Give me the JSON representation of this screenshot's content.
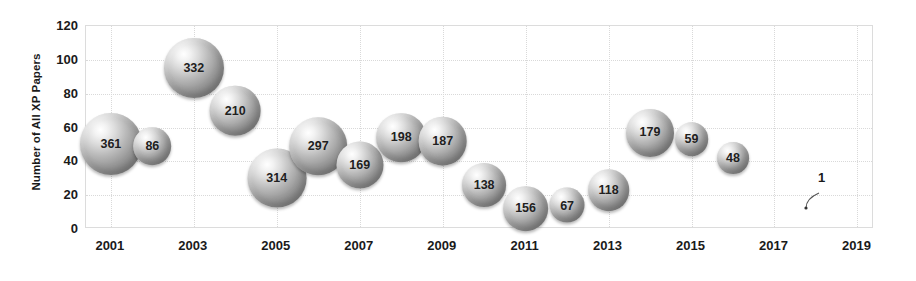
{
  "chart_data": {
    "type": "scatter",
    "title": "",
    "subtitle": "",
    "xlabel": "",
    "ylabel": "Number of All XP Papers",
    "xlim": [
      2000.4,
      2019.4
    ],
    "ylim": [
      0,
      120
    ],
    "grid": true,
    "legend": null,
    "x_ticks": [
      "2001",
      "2003",
      "2005",
      "2007",
      "2009",
      "2011",
      "2013",
      "2015",
      "2017",
      "2019"
    ],
    "x_tick_values": [
      2001,
      2003,
      2005,
      2007,
      2009,
      2011,
      2013,
      2015,
      2017,
      2019
    ],
    "y_ticks": [
      "0",
      "20",
      "40",
      "60",
      "80",
      "100",
      "120"
    ],
    "y_tick_values": [
      0,
      20,
      40,
      60,
      80,
      100,
      120
    ],
    "series": [
      {
        "name": "XP papers",
        "points": [
          {
            "x": 2001,
            "y": 50,
            "size": 361,
            "label": "361"
          },
          {
            "x": 2002,
            "y": 49,
            "size": 86,
            "label": "86"
          },
          {
            "x": 2003,
            "y": 95,
            "size": 332,
            "label": "332"
          },
          {
            "x": 2004,
            "y": 70,
            "size": 210,
            "label": "210"
          },
          {
            "x": 2005,
            "y": 30,
            "size": 314,
            "label": "314"
          },
          {
            "x": 2006,
            "y": 49,
            "size": 297,
            "label": "297"
          },
          {
            "x": 2007,
            "y": 38,
            "size": 169,
            "label": "169"
          },
          {
            "x": 2008,
            "y": 54,
            "size": 198,
            "label": "198"
          },
          {
            "x": 2009,
            "y": 52,
            "size": 187,
            "label": "187"
          },
          {
            "x": 2010,
            "y": 26,
            "size": 138,
            "label": "138"
          },
          {
            "x": 2011,
            "y": 12,
            "size": 156,
            "label": "156"
          },
          {
            "x": 2012,
            "y": 14,
            "size": 67,
            "label": "67"
          },
          {
            "x": 2013,
            "y": 23,
            "size": 118,
            "label": "118"
          },
          {
            "x": 2014,
            "y": 57,
            "size": 179,
            "label": "179"
          },
          {
            "x": 2015,
            "y": 53,
            "size": 59,
            "label": "59"
          },
          {
            "x": 2016,
            "y": 42,
            "size": 48,
            "label": "48"
          },
          {
            "x": 2018,
            "y": 17,
            "size": 1,
            "label": "1"
          }
        ]
      }
    ],
    "annotations": [
      {
        "text": "1",
        "x": 2018,
        "y": 17,
        "style": "leader-line"
      }
    ],
    "colors": {
      "bubble_light": "#ffffff",
      "bubble_mid": "#b9b9b9",
      "bubble_dark": "#7c7c7c",
      "grid": "#d9d9d9",
      "axis_border": "#dcdcdc",
      "text": "#1a1a1a",
      "background": "#ffffff"
    }
  }
}
